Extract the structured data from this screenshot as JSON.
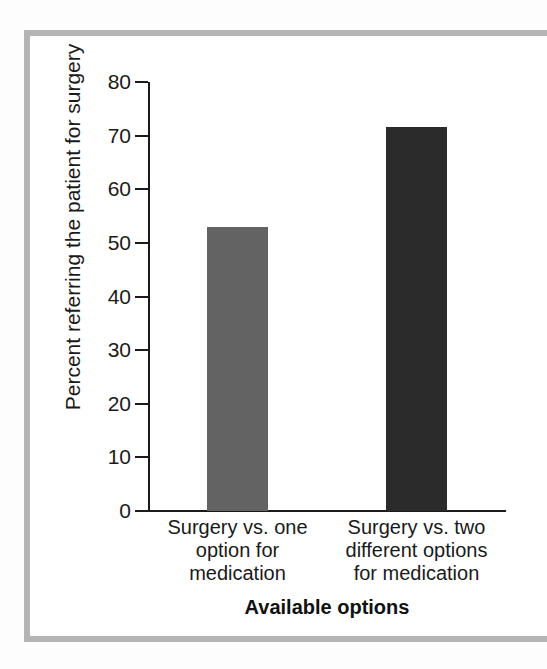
{
  "figure": {
    "frame_color": "#b4b4b4",
    "paper_color": "#ffffff",
    "axis_color": "#1a1a1a"
  },
  "chart_data": {
    "type": "bar",
    "title": "",
    "subtitle": "",
    "xlabel": "Available options",
    "ylabel": "Percent referring the patient for surgery",
    "categories": [
      "Surgery vs. one\noption for\nmedication",
      "Surgery vs. two\ndifferent options\nfor medication"
    ],
    "category_lines": [
      [
        "Surgery vs. one",
        "option for",
        "medication"
      ],
      [
        "Surgery vs. two",
        "different options",
        "for medication"
      ]
    ],
    "values": [
      53,
      71.6
    ],
    "bar_colors": [
      "#636363",
      "#2b2b2b"
    ],
    "ylim": [
      0,
      80
    ],
    "yticks": [
      0,
      10,
      20,
      30,
      40,
      50,
      60,
      70,
      80
    ],
    "ytick_labels": [
      "0",
      "10",
      "20",
      "30",
      "40",
      "50",
      "60",
      "70",
      "80"
    ],
    "grid": false,
    "legend": false,
    "legend_position": "none"
  }
}
